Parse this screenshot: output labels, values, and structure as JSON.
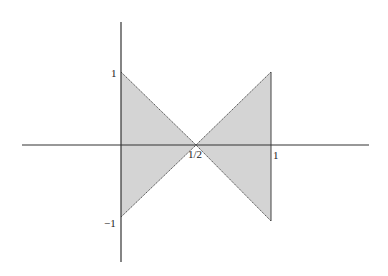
{
  "figure": {
    "type": "bowtie region plot",
    "fill_color": "#d4d4d4",
    "edge_color": "#555555",
    "axis_color": "#333333",
    "labels": {
      "y_top": "1",
      "y_bottom": "−1",
      "x_half": "1/2",
      "x_one": "1"
    },
    "regions": [
      {
        "name": "left-triangle",
        "vertices": [
          [
            0,
            1
          ],
          [
            0.5,
            0
          ],
          [
            0,
            -1
          ]
        ]
      },
      {
        "name": "right-triangle",
        "vertices": [
          [
            1,
            1
          ],
          [
            0.5,
            0
          ],
          [
            1,
            -1
          ]
        ]
      }
    ]
  }
}
